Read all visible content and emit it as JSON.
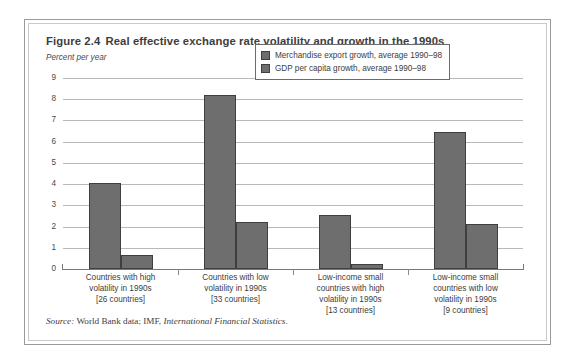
{
  "figure": {
    "number": "Figure 2.4",
    "title": "Real effective exchange rate volatility and growth in the 1990s",
    "subtitle": "Percent per year",
    "source_lead": "Source:",
    "source_text": "World Bank data; IMF,",
    "source_publication": "International Financial Statistics",
    "source_end": "."
  },
  "chart_data": {
    "type": "bar",
    "title": "Real effective exchange rate volatility and growth in the 1990s",
    "subtitle": "Percent per year",
    "xlabel": "",
    "ylabel": "Percent per year",
    "ylim": [
      0,
      9
    ],
    "yticks": [
      0,
      1,
      2,
      3,
      4,
      5,
      6,
      7,
      8,
      9
    ],
    "ytick_labels": [
      "0",
      "1",
      "2",
      "3",
      "4",
      "5",
      "6",
      "7",
      "8",
      "9"
    ],
    "grid": true,
    "legend_position": "top-right-inside",
    "categories": [
      "Countries with high volatility in 1990s [26 countries]",
      "Countries with low volatility in 1990s [33 countries]",
      "Low-income small countries with high volatility in 1990s [13 countries]",
      "Low-income small countries with low volatility in 1990s [9 countries]"
    ],
    "category_lines": [
      [
        "Countries with high",
        "volatility in 1990s",
        "[26 countries]"
      ],
      [
        "Countries with low",
        "volatility in 1990s",
        "[33 countries]"
      ],
      [
        "Low-income small",
        "countries with high",
        "volatility in 1990s",
        "[13 countries]"
      ],
      [
        "Low-income small",
        "countries with low",
        "volatility in 1990s",
        "[9 countries]"
      ]
    ],
    "series": [
      {
        "name": "Merchandise export growth, average 1990–98",
        "color": "#6e6e6e",
        "values": [
          4.05,
          8.2,
          2.55,
          6.45
        ]
      },
      {
        "name": "GDP per capita growth, average 1990–98",
        "color": "#6e6e6e",
        "values": [
          0.65,
          2.2,
          0.25,
          2.1
        ]
      }
    ]
  },
  "legend": {
    "items": [
      "Merchandise export growth, average 1990–98",
      "GDP per capita growth, average 1990–98"
    ]
  },
  "colors": {
    "bar_fill": "#6e6e6e",
    "bar_stroke": "#3f3f3f",
    "gridline": "#b9b9b9",
    "frame_outer": "#9a9a9a",
    "frame_inner": "#c9c9c9",
    "text": "#3d3d3d"
  }
}
